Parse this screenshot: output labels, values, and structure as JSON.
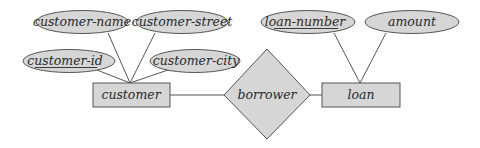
{
  "diagram": {
    "type": "entity-relationship",
    "entities": [
      {
        "name": "customer",
        "attributes": [
          "customer-id",
          "customer-name",
          "customer-street",
          "customer-city"
        ],
        "primary_key": "customer-id"
      },
      {
        "name": "loan",
        "attributes": [
          "loan-number",
          "amount"
        ],
        "primary_key": "loan-number"
      }
    ],
    "relationships": [
      {
        "name": "borrower",
        "connects": [
          "customer",
          "loan"
        ]
      }
    ],
    "labels": {
      "customer_name": "customer-name",
      "customer_street": "customer-street",
      "customer_id": "customer-id",
      "customer_city": "customer-city",
      "customer": "customer",
      "borrower": "borrower",
      "loan": "loan",
      "loan_number": "loan-number",
      "amount": "amount"
    },
    "colors": {
      "fill": "#d6d6d6",
      "stroke": "#555555",
      "text": "#2a2a2a"
    }
  }
}
